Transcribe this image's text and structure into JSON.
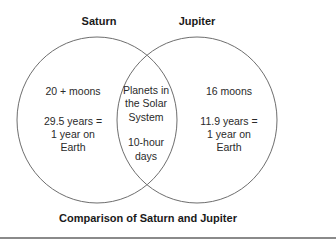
{
  "diagram": {
    "type": "venn",
    "caption": "Comparison of Saturn and Jupiter",
    "stroke_color": "#6e6e6e",
    "sets": [
      {
        "title": "Saturn",
        "unique_items": [
          "20 + moons",
          "29.5 years = 1 year on Earth"
        ],
        "lines": {
          "l1": "20 + moons",
          "l2": "29.5 years =",
          "l3": "1 year on",
          "l4": "Earth"
        }
      },
      {
        "title": "Jupiter",
        "unique_items": [
          "16 moons",
          "11.9 years = 1 year on Earth"
        ],
        "lines": {
          "l1": "16 moons",
          "l2": "11.9 years =",
          "l3": "1 year on",
          "l4": "Earth"
        }
      }
    ],
    "intersection": {
      "items": [
        "Planets in the Solar System",
        "10-hour days"
      ],
      "lines": {
        "l1": "Planets in",
        "l2": "the Solar",
        "l3": "System",
        "l4": "10-hour",
        "l5": "days"
      }
    }
  }
}
